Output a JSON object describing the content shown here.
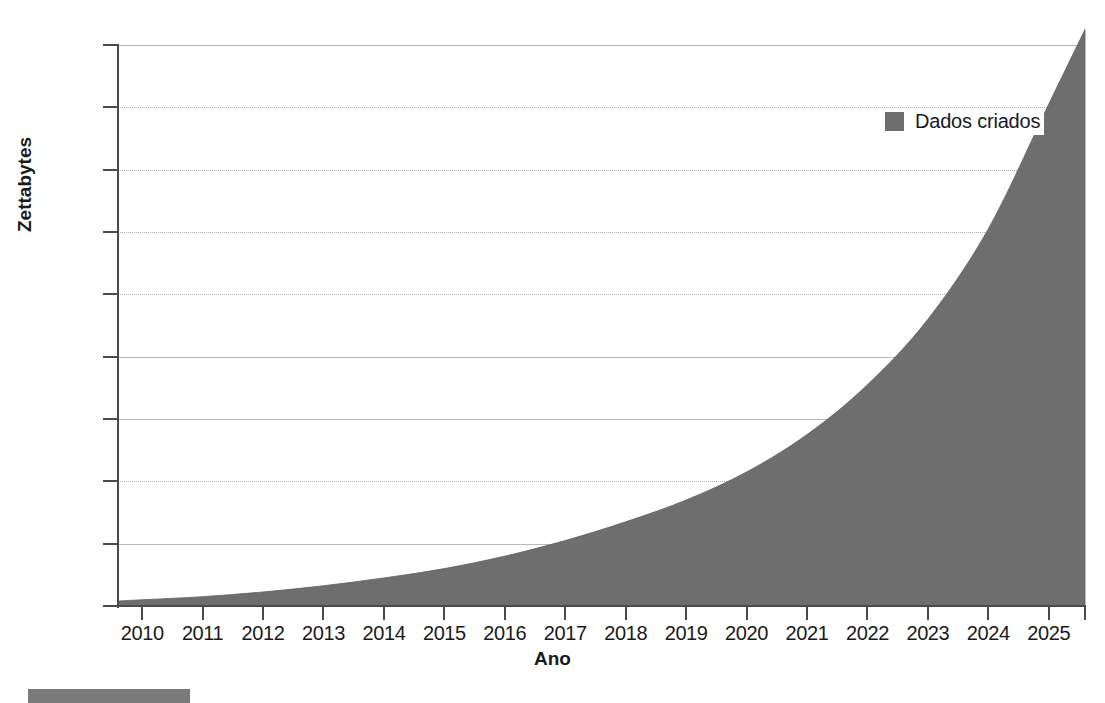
{
  "chart_data": {
    "type": "area",
    "title": "",
    "subtitle": "",
    "xlabel": "Ano",
    "ylabel": "Zettabytes",
    "categories": [
      "2010",
      "2011",
      "2012",
      "2013",
      "2014",
      "2015",
      "2016",
      "2017",
      "2018",
      "2019",
      "2020",
      "2021",
      "2022",
      "2023",
      "2024",
      "2025"
    ],
    "x": [
      2010,
      2011,
      2012,
      2013,
      2014,
      2015,
      2016,
      2017,
      2018,
      2019,
      2020,
      2021,
      2022,
      2023,
      2024,
      2025
    ],
    "series": [
      {
        "name": "Dados criados",
        "color": "#6e6e6e",
        "values": [
          2,
          3,
          4.5,
          6.5,
          9,
          12,
          16,
          21,
          27,
          34,
          43,
          55,
          71,
          92,
          121,
          161
        ]
      }
    ],
    "ylim": [
      0,
      180
    ],
    "yticks": [
      0,
      20,
      40,
      60,
      80,
      100,
      120,
      140,
      160,
      180
    ],
    "ytick_labels": [
      "0",
      "20",
      "40",
      "60",
      "80",
      "100",
      "120",
      "140",
      "160",
      "180"
    ],
    "xlim": [
      2009.6,
      2025.6
    ],
    "grid": true,
    "grid_axis": "y",
    "legend": {
      "position": "top-right",
      "entries": [
        {
          "label": "Dados criados",
          "swatch_color": "#6e6e6e",
          "icon": "square-swatch-icon"
        }
      ]
    },
    "axis_color": "#4a4a4a",
    "grid_color": "#b9b9b9",
    "background": "#ffffff"
  },
  "figure": {
    "x_axis_title": "Ano",
    "y_axis_title": "Zettabytes"
  }
}
